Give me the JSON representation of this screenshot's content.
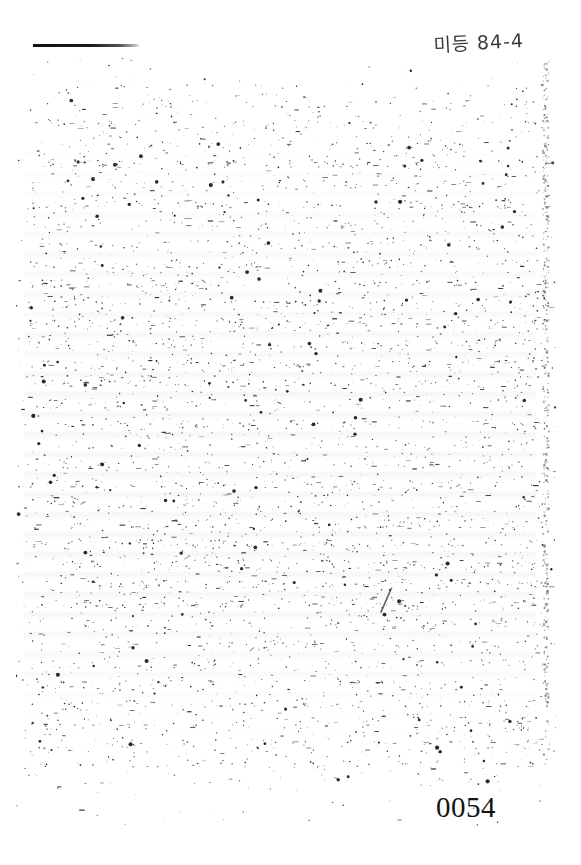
{
  "document": {
    "type": "scanned-document-page",
    "condition": "faded-degraded-scan",
    "background_color": "#ffffff",
    "ink_color": "#1b1b1b",
    "body_text_legible": false,
    "body_text": ""
  },
  "annotations": {
    "handwritten_note": {
      "text": "미등 84-4",
      "location": "top-right",
      "script": "korean-hangul-and-digits"
    }
  },
  "marks": {
    "top_rule": {
      "name": "horizontal-rule",
      "location": "top-left"
    },
    "scan_edge": {
      "name": "vertical-scan-artifact",
      "location": "right-margin"
    },
    "pen_stroke": {
      "name": "diagonal-pen-stroke",
      "location": "mid-page-right"
    }
  },
  "footer": {
    "page_number": "0054",
    "location": "bottom-right"
  }
}
